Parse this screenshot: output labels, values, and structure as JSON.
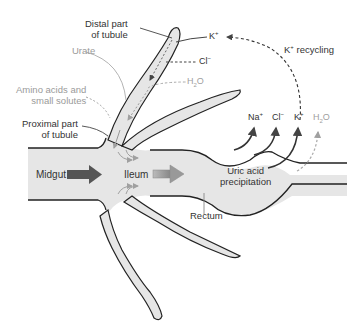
{
  "diagram": {
    "colors": {
      "tissue_fill": "#e6e6e6",
      "outline": "#222222",
      "arrow_dark": "#555555",
      "arrow_grey": "#a8a8a8",
      "label_dark": "#333333",
      "label_grey": "#9a9a9a"
    },
    "labels": {
      "distal_line1": "Distal part",
      "distal_line2": "of tubule",
      "urate": "Urate",
      "amino_line1": "Amino acids and",
      "amino_line2": "small solutes",
      "proximal_line1": "Proximal part",
      "proximal_line2": "of tubule",
      "midgut": "Midgut",
      "ileum": "Ileum",
      "rectum": "Rectum",
      "uric_line1": "Uric acid",
      "uric_line2": "precipitation",
      "k_recycling": "recycling"
    },
    "ions": {
      "tubule_k": {
        "base": "K",
        "sup": "+"
      },
      "tubule_cl": {
        "base": "Cl",
        "sup": "−"
      },
      "tubule_h2o": {
        "base1": "H",
        "sub": "2",
        "base2": "O"
      },
      "rect_na": {
        "base": "Na",
        "sup": "+"
      },
      "rect_cl": {
        "base": "Cl",
        "sup": "−"
      },
      "rect_k": {
        "base": "K",
        "sup": "+"
      },
      "rect_h2o": {
        "base1": "H",
        "sub": "2",
        "base2": "O"
      },
      "recycle_k": {
        "base": "K",
        "sup": "+"
      }
    }
  }
}
